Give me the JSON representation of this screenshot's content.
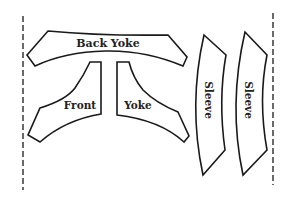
{
  "diagram": {
    "type": "sewing-pattern-layout",
    "fold_lines": [
      "left",
      "right"
    ],
    "pieces": [
      {
        "id": "back-yoke",
        "label": "Back Yoke"
      },
      {
        "id": "front-yoke-left",
        "label": "Front"
      },
      {
        "id": "front-yoke-right",
        "label": "Yoke"
      },
      {
        "id": "sleeve-1",
        "label": "Sleeve"
      },
      {
        "id": "sleeve-2",
        "label": "Sleeve"
      }
    ],
    "colors": {
      "line": "#1a1a1a",
      "background": "#ffffff"
    }
  }
}
